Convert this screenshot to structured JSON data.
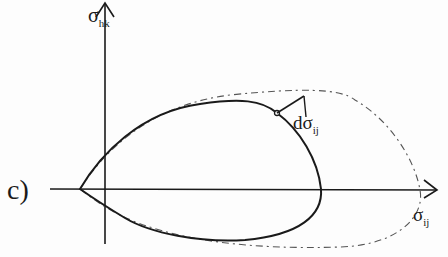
{
  "figure": {
    "panel_label": "c)",
    "axes": {
      "x_axis": {
        "symbol": "σ",
        "subscript": "ij"
      },
      "y_axis": {
        "symbol": "σ",
        "subscript": "hk"
      }
    },
    "vector_label": {
      "prefix": "dσ",
      "subscript": "ij"
    },
    "curves": [
      {
        "name": "current-yield-surface",
        "style": "solid"
      },
      {
        "name": "subsequent-yield-surface",
        "style": "dash-dot"
      }
    ],
    "colors": {
      "ink": "#1a1a1a",
      "dashed": "#555555",
      "background": "#fdfdfd"
    }
  }
}
